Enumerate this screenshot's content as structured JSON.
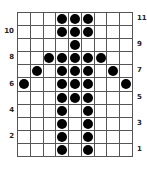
{
  "pattern": {
    "columns": 9,
    "rows": 11,
    "filled": {
      "11": [
        4,
        5,
        6
      ],
      "10": [
        4,
        5,
        6
      ],
      "9": [
        5
      ],
      "8": [
        3,
        4,
        5,
        6,
        7
      ],
      "7": [
        2,
        4,
        5,
        6,
        8
      ],
      "6": [
        1,
        4,
        5,
        6,
        9
      ],
      "5": [
        4,
        5,
        6
      ],
      "4": [
        4,
        6
      ],
      "3": [
        4,
        6
      ],
      "2": [
        4,
        6
      ],
      "1": [
        4,
        6
      ]
    },
    "row_labels_left": [
      "10",
      "8",
      "6",
      "4",
      "2"
    ],
    "row_labels_right": [
      "11",
      "9",
      "7",
      "5",
      "3",
      "1"
    ]
  },
  "colors": {
    "dot": "#000000",
    "grid_line": "#555555"
  }
}
